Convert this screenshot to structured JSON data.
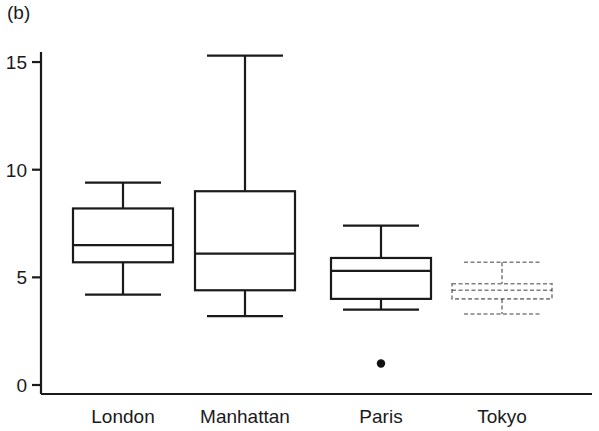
{
  "panel": {
    "label": "(b)"
  },
  "chart_data": {
    "type": "box",
    "title": "",
    "xlabel": "",
    "ylabel": "",
    "categories": [
      "London",
      "Manhattan",
      "Paris",
      "Tokyo"
    ],
    "yticks": [
      0,
      5,
      10,
      15
    ],
    "ytick_labels": [
      "0",
      "5",
      "10",
      "15"
    ],
    "ylim": [
      0,
      16.2
    ],
    "grid": false,
    "legend": "none",
    "boxes": [
      {
        "name": "London",
        "whisker_low": 4.2,
        "q1": 5.7,
        "median": 6.5,
        "q3": 8.2,
        "whisker_high": 9.4,
        "outliers": [],
        "style": "solid"
      },
      {
        "name": "Manhattan",
        "whisker_low": 3.2,
        "q1": 4.4,
        "median": 6.1,
        "q3": 9.0,
        "whisker_high": 15.3,
        "outliers": [],
        "style": "solid"
      },
      {
        "name": "Paris",
        "whisker_low": 3.5,
        "q1": 4.0,
        "median": 5.3,
        "q3": 5.9,
        "whisker_high": 7.4,
        "outliers": [
          1.0
        ],
        "style": "solid"
      },
      {
        "name": "Tokyo",
        "whisker_low": 3.3,
        "q1": 4.0,
        "median": 4.4,
        "q3": 4.7,
        "whisker_high": 5.7,
        "outliers": [],
        "style": "faded"
      }
    ],
    "colors": {
      "line": "#1a1a1a",
      "axis": "#1a1a1a",
      "background": "#ffffff",
      "outlier": "#111111"
    }
  },
  "layout": {
    "axis_x": 41,
    "axis_baseline_y": 394,
    "plot_right": 592,
    "y_zero_px": 385,
    "px_per_unit": 21.53,
    "box_centers": [
      123,
      245,
      381,
      502
    ],
    "box_half_width": 50,
    "cap_half_width": 38
  }
}
